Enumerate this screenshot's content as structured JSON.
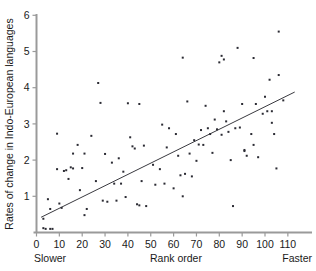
{
  "chart_data": {
    "type": "scatter",
    "title": "",
    "xlabel": "Rank order",
    "ylabel": "Rates of change in Indo-European languages",
    "xlim": [
      0,
      117
    ],
    "ylim": [
      0,
      6
    ],
    "grid": false,
    "legend": null,
    "x_ticks": [
      0,
      10,
      20,
      30,
      40,
      50,
      60,
      70,
      80,
      90,
      100,
      110
    ],
    "x_tick_labels": [
      "0",
      "10",
      "20",
      "30",
      "40",
      "50",
      "60",
      "70",
      "80",
      "90",
      "100",
      "110"
    ],
    "y_ticks": [
      1,
      2,
      3,
      4,
      5,
      6
    ],
    "y_tick_labels": [
      "1",
      "2",
      "3",
      "4",
      "5",
      "6"
    ],
    "annotations": [
      {
        "text": "Slower",
        "position": "x-axis-left"
      },
      {
        "text": "Rank order",
        "position": "x-axis-center"
      },
      {
        "text": "Faster",
        "position": "x-axis-right"
      }
    ],
    "marker": {
      "shape": "square",
      "size": 2,
      "color": "#2b2b33"
    },
    "trendline": {
      "type": "linear",
      "x_start": 2.0,
      "y_start": 0.42,
      "x_end": 113.0,
      "y_end": 3.88,
      "color": "#3a3a40"
    },
    "points": [
      [
        3,
        0.38
      ],
      [
        3,
        0.12
      ],
      [
        4,
        0.1
      ],
      [
        5,
        0.92
      ],
      [
        6,
        0.1
      ],
      [
        6,
        0.65
      ],
      [
        7,
        0.1
      ],
      [
        9,
        1.75
      ],
      [
        9,
        2.73
      ],
      [
        10,
        0.8
      ],
      [
        11,
        0.68
      ],
      [
        12,
        1.7
      ],
      [
        13,
        1.72
      ],
      [
        14,
        1.48
      ],
      [
        15,
        1.8
      ],
      [
        16,
        1.77
      ],
      [
        16,
        2.18
      ],
      [
        18,
        2.42
      ],
      [
        19,
        1.17
      ],
      [
        20,
        1.78
      ],
      [
        21,
        0.48
      ],
      [
        21,
        2.18
      ],
      [
        22,
        0.65
      ],
      [
        24,
        2.67
      ],
      [
        26,
        1.42
      ],
      [
        27,
        4.13
      ],
      [
        28,
        3.58
      ],
      [
        29,
        0.88
      ],
      [
        30,
        2.17
      ],
      [
        31,
        0.85
      ],
      [
        33,
        1.93
      ],
      [
        34,
        1.35
      ],
      [
        35,
        0.88
      ],
      [
        36,
        2.05
      ],
      [
        37,
        1.35
      ],
      [
        38,
        1.68
      ],
      [
        39,
        0.98
      ],
      [
        40,
        3.57
      ],
      [
        41,
        2.63
      ],
      [
        42,
        2.38
      ],
      [
        43,
        2.32
      ],
      [
        44,
        0.78
      ],
      [
        45,
        0.75
      ],
      [
        45,
        3.55
      ],
      [
        46,
        1.42
      ],
      [
        47,
        2.4
      ],
      [
        48,
        0.73
      ],
      [
        51,
        1.87
      ],
      [
        52,
        1.32
      ],
      [
        54,
        1.75
      ],
      [
        55,
        2.98
      ],
      [
        56,
        1.35
      ],
      [
        57,
        2.35
      ],
      [
        58,
        2.88
      ],
      [
        60,
        1.22
      ],
      [
        61,
        2.72
      ],
      [
        62,
        2.12
      ],
      [
        63,
        1.58
      ],
      [
        64,
        4.83
      ],
      [
        64,
        1.0
      ],
      [
        65,
        1.62
      ],
      [
        66,
        3.62
      ],
      [
        67,
        2.18
      ],
      [
        68,
        1.55
      ],
      [
        69,
        2.55
      ],
      [
        70,
        1.98
      ],
      [
        71,
        2.43
      ],
      [
        72,
        2.83
      ],
      [
        73,
        2.42
      ],
      [
        74,
        3.5
      ],
      [
        75,
        2.88
      ],
      [
        76,
        2.72
      ],
      [
        77,
        2.2
      ],
      [
        78,
        3.12
      ],
      [
        79,
        2.85
      ],
      [
        80,
        4.7
      ],
      [
        81,
        4.88
      ],
      [
        81,
        2.7
      ],
      [
        82,
        4.78
      ],
      [
        82,
        3.35
      ],
      [
        83,
        3.07
      ],
      [
        84,
        2.78
      ],
      [
        85,
        2.0
      ],
      [
        86,
        0.73
      ],
      [
        87,
        2.88
      ],
      [
        88,
        5.1
      ],
      [
        89,
        2.9
      ],
      [
        90,
        3.55
      ],
      [
        91,
        2.25
      ],
      [
        91,
        2.28
      ],
      [
        92,
        2.12
      ],
      [
        94,
        2.72
      ],
      [
        95,
        4.82
      ],
      [
        95,
        2.42
      ],
      [
        96,
        3.55
      ],
      [
        97,
        2.08
      ],
      [
        99,
        3.28
      ],
      [
        100,
        3.75
      ],
      [
        101,
        3.35
      ],
      [
        102,
        4.22
      ],
      [
        103,
        3.35
      ],
      [
        103,
        3.03
      ],
      [
        104,
        2.72
      ],
      [
        105,
        1.77
      ],
      [
        106,
        5.55
      ],
      [
        106,
        4.35
      ],
      [
        108,
        3.65
      ]
    ]
  }
}
